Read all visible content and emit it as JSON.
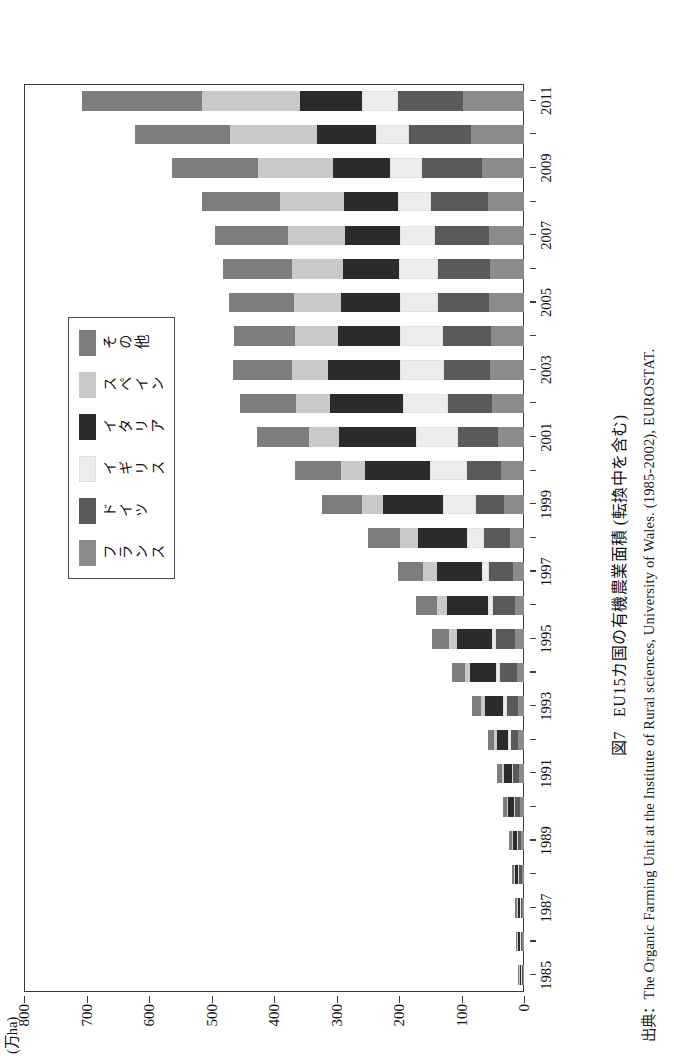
{
  "figure": {
    "caption_number": "図7",
    "caption_title": "EU15カ国の有機農業面積",
    "caption_sub": "(転換中を含む)",
    "source_note": "出典：The Organic Farming Unit at the Institute of Rural sciences, University of Wales. (1985-2002), EUROSTAT."
  },
  "axis": {
    "unit_label": "(万ha)",
    "value_ticks": [
      "0",
      "100",
      "200",
      "300",
      "400",
      "500",
      "600",
      "700",
      "800"
    ],
    "value_min": 0,
    "value_max": 800,
    "year_ticks": [
      "1985",
      "1987",
      "1989",
      "1991",
      "1993",
      "1995",
      "1997",
      "1999",
      "2001",
      "2003",
      "2005",
      "2007",
      "2009",
      "2011"
    ]
  },
  "legend": {
    "items": [
      {
        "label": "フランス",
        "color": "#8c8c8c"
      },
      {
        "label": "ドイツ",
        "color": "#5a5a5a"
      },
      {
        "label": "イギリス",
        "color": "#ededed"
      },
      {
        "label": "イタリア",
        "color": "#2b2b2b"
      },
      {
        "label": "スペイン",
        "color": "#c9c9c9"
      },
      {
        "label": "その他",
        "color": "#7d7d7d"
      }
    ]
  },
  "chart_data": {
    "type": "bar",
    "orientation": "horizontal-stacked",
    "xlabel": "",
    "ylabel": "(万ha)",
    "ylim": [
      0,
      800
    ],
    "grid": false,
    "legend_position": "inside-upper-right",
    "categories": [
      "1985",
      "1986",
      "1987",
      "1988",
      "1989",
      "1990",
      "1991",
      "1992",
      "1993",
      "1994",
      "1995",
      "1996",
      "1997",
      "1998",
      "1999",
      "2000",
      "2001",
      "2002",
      "2003",
      "2004",
      "2005",
      "2006",
      "2007",
      "2008",
      "2009",
      "2010",
      "2011"
    ],
    "series": [
      {
        "name": "フランス",
        "color": "#8c8c8c",
        "values": [
          2,
          3,
          3,
          4,
          5,
          7,
          8,
          9,
          10,
          12,
          14,
          15,
          17,
          22,
          32,
          37,
          42,
          51,
          55,
          53,
          56,
          55,
          56,
          58,
          68,
          85,
          98
        ]
      },
      {
        "name": "ドイツ",
        "color": "#5a5a5a",
        "values": [
          2,
          3,
          3,
          4,
          5,
          7,
          9,
          12,
          18,
          27,
          31,
          35,
          39,
          42,
          45,
          55,
          63,
          70,
          73,
          77,
          81,
          83,
          87,
          91,
          95,
          99,
          103
        ]
      },
      {
        "name": "イギリス",
        "color": "#ededed",
        "values": [
          1,
          1,
          1,
          1,
          2,
          2,
          3,
          4,
          5,
          6,
          7,
          8,
          12,
          28,
          52,
          58,
          68,
          72,
          70,
          69,
          61,
          62,
          55,
          53,
          52,
          53,
          58
        ]
      },
      {
        "name": "イタリア",
        "color": "#2b2b2b",
        "values": [
          2,
          3,
          4,
          5,
          6,
          9,
          12,
          18,
          30,
          41,
          55,
          65,
          72,
          78,
          96,
          104,
          123,
          118,
          115,
          99,
          95,
          90,
          88,
          86,
          91,
          94,
          100
        ]
      },
      {
        "name": "スペイン",
        "color": "#c9c9c9",
        "values": [
          1,
          1,
          1,
          2,
          2,
          3,
          4,
          5,
          6,
          9,
          13,
          17,
          21,
          28,
          35,
          39,
          48,
          54,
          59,
          68,
          75,
          82,
          91,
          102,
          119,
          140,
          156
        ]
      },
      {
        "name": "その他",
        "color": "#7d7d7d",
        "values": [
          1,
          2,
          2,
          3,
          4,
          5,
          7,
          9,
          14,
          20,
          27,
          33,
          41,
          52,
          63,
          73,
          83,
          90,
          94,
          98,
          104,
          110,
          118,
          126,
          138,
          152,
          192
        ]
      }
    ]
  }
}
